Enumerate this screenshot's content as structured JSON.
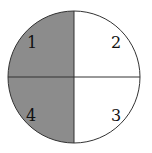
{
  "diagram": {
    "type": "circle-quadrants",
    "quadrants": [
      {
        "label": "1",
        "position": "top-left",
        "shaded": true
      },
      {
        "label": "2",
        "position": "top-right",
        "shaded": false
      },
      {
        "label": "3",
        "position": "bottom-right",
        "shaded": false
      },
      {
        "label": "4",
        "position": "bottom-left",
        "shaded": false
      }
    ],
    "colors": {
      "shade": "#8c8c8c",
      "stroke": "#333333",
      "background": "#ffffff"
    }
  }
}
